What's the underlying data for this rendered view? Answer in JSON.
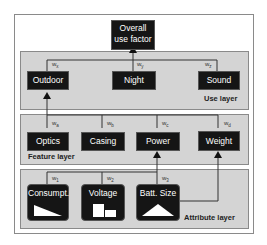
{
  "top": {
    "label_line1": "Overall",
    "label_line2": "use factor"
  },
  "use_layer": {
    "title": "Use layer",
    "nodes": [
      "Outdoor",
      "Night",
      "Sound"
    ],
    "weights": [
      "x",
      "y",
      "z"
    ]
  },
  "feature_layer": {
    "title": "Feature layer",
    "nodes": [
      "Optics",
      "Casing",
      "Power",
      "Weight"
    ],
    "weights": [
      "a",
      "b",
      "c",
      "d"
    ]
  },
  "attribute_layer": {
    "title": "Attribute layer",
    "nodes": [
      "Consumpt.",
      "Voltage",
      "Batt. Size"
    ],
    "weights": [
      "1",
      "2",
      "3"
    ]
  },
  "weight_prefix": "w"
}
